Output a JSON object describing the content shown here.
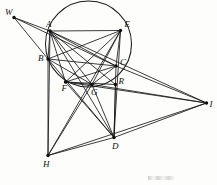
{
  "figure": {
    "type": "geometric-construction",
    "background_color": "#fdfdfc",
    "ink_color": "#1a1a1a",
    "canvas": {
      "width": 217,
      "height": 185
    },
    "circle": {
      "name": "main-circle",
      "cx": 88.5,
      "cy": 44.0,
      "r": 43.0
    },
    "points": [
      {
        "id": "W",
        "label": "W",
        "x": 14.0,
        "y": 17.5,
        "label_dx": -9,
        "label_dy": -10,
        "dot": true
      },
      {
        "id": "A",
        "label": "A",
        "x": 50.0,
        "y": 31.0,
        "label_dx": -4,
        "label_dy": -11,
        "dot": true
      },
      {
        "id": "E",
        "label": "E",
        "x": 120.5,
        "y": 30.5,
        "label_dx": 4,
        "label_dy": -11,
        "dot": true
      },
      {
        "id": "B",
        "label": "B",
        "x": 48.0,
        "y": 59.0,
        "label_dx": -10,
        "label_dy": -5,
        "dot": true
      },
      {
        "id": "C",
        "label": "C",
        "x": 116.0,
        "y": 66.0,
        "label_dx": 4,
        "label_dy": -8,
        "dot": true
      },
      {
        "id": "F",
        "label": "F",
        "x": 65.5,
        "y": 82.0,
        "label_dx": -4,
        "label_dy": 2,
        "dot": true
      },
      {
        "id": "G",
        "label": "G",
        "x": 92.0,
        "y": 84.5,
        "label_dx": -1,
        "label_dy": 3,
        "dot": true
      },
      {
        "id": "R",
        "label": "R",
        "x": 115.5,
        "y": 84.5,
        "label_dx": 3,
        "label_dy": -8,
        "dot": true
      },
      {
        "id": "H",
        "label": "H",
        "x": 48.0,
        "y": 155.5,
        "label_dx": -5,
        "label_dy": 4,
        "dot": true
      },
      {
        "id": "D",
        "label": "D",
        "x": 114.0,
        "y": 137.5,
        "label_dx": -2,
        "label_dy": 4,
        "dot": true
      },
      {
        "id": "I",
        "label": "I",
        "x": 206.5,
        "y": 103.0,
        "label_dx": 3,
        "label_dy": -3,
        "dot": true
      }
    ],
    "segments": [
      {
        "name": "W-A",
        "from": "W",
        "to": "A"
      },
      {
        "name": "W-B",
        "from": "W",
        "to": "B"
      },
      {
        "name": "W-C",
        "from": "W",
        "to": "C"
      },
      {
        "name": "A-E",
        "from": "A",
        "to": "E"
      },
      {
        "name": "A-B",
        "from": "A",
        "to": "B"
      },
      {
        "name": "A-H",
        "from": "A",
        "to": "H"
      },
      {
        "name": "A-C",
        "from": "A",
        "to": "C"
      },
      {
        "name": "A-F",
        "from": "A",
        "to": "F"
      },
      {
        "name": "A-G",
        "from": "A",
        "to": "G"
      },
      {
        "name": "A-R",
        "from": "A",
        "to": "R"
      },
      {
        "name": "A-D",
        "from": "A",
        "to": "D"
      },
      {
        "name": "A-I",
        "from": "A",
        "to": "I"
      },
      {
        "name": "B-C",
        "from": "B",
        "to": "C"
      },
      {
        "name": "B-G",
        "from": "B",
        "to": "G"
      },
      {
        "name": "B-D",
        "from": "B",
        "to": "D"
      },
      {
        "name": "B-H",
        "from": "B",
        "to": "H"
      },
      {
        "name": "E-C",
        "from": "E",
        "to": "C"
      },
      {
        "name": "E-F",
        "from": "E",
        "to": "F"
      },
      {
        "name": "E-G",
        "from": "E",
        "to": "G"
      },
      {
        "name": "E-H",
        "from": "E",
        "to": "H"
      },
      {
        "name": "E-D",
        "from": "E",
        "to": "D"
      },
      {
        "name": "E-B",
        "from": "E",
        "to": "B"
      },
      {
        "name": "C-D",
        "from": "C",
        "to": "D"
      },
      {
        "name": "C-I",
        "from": "C",
        "to": "I"
      },
      {
        "name": "C-F",
        "from": "C",
        "to": "F"
      },
      {
        "name": "C-G",
        "from": "C",
        "to": "G"
      },
      {
        "name": "F-R",
        "from": "F",
        "to": "R"
      },
      {
        "name": "F-I",
        "from": "F",
        "to": "I"
      },
      {
        "name": "F-D",
        "from": "F",
        "to": "D"
      },
      {
        "name": "G-D",
        "from": "G",
        "to": "D"
      },
      {
        "name": "G-I",
        "from": "G",
        "to": "I"
      },
      {
        "name": "G-H",
        "from": "G",
        "to": "H"
      },
      {
        "name": "R-D",
        "from": "R",
        "to": "D"
      },
      {
        "name": "H-D",
        "from": "H",
        "to": "D"
      },
      {
        "name": "H-I",
        "from": "H",
        "to": "I"
      },
      {
        "name": "D-I",
        "from": "D",
        "to": "I"
      },
      {
        "name": "F-G",
        "from": "F",
        "to": "G"
      }
    ]
  }
}
